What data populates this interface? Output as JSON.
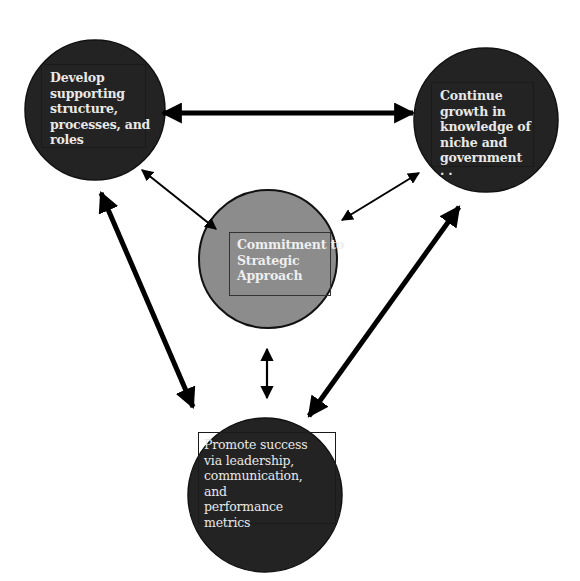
{
  "diagram": {
    "type": "cycle-with-hub",
    "colors": {
      "outer_circle_fill": "#222222",
      "hub_circle_fill": "#8c8c8c",
      "text": "#e8e8e8",
      "arrow": "#000000",
      "background": "#ffffff"
    },
    "nodes": [
      {
        "id": "left",
        "label": "Develop\nsupporting\nstructure,\nprocesses, and\nroles"
      },
      {
        "id": "right",
        "label": "Continue\ngrowth in\nknowledge of\nniche and\ngovernment\n    · ·"
      },
      {
        "id": "hub",
        "label": "Commitment to\nStrategic\nApproach"
      },
      {
        "id": "bottom",
        "label": "Promote success\nvia leadership,\ncommunication,\nand\nperformance\nmetrics"
      }
    ],
    "edges": [
      {
        "from": "left",
        "to": "right",
        "bidirectional": true,
        "weight": "thick"
      },
      {
        "from": "left",
        "to": "bottom",
        "bidirectional": true,
        "weight": "thick"
      },
      {
        "from": "right",
        "to": "bottom",
        "bidirectional": true,
        "weight": "thick"
      },
      {
        "from": "hub",
        "to": "left",
        "bidirectional": true,
        "weight": "thin"
      },
      {
        "from": "hub",
        "to": "right",
        "bidirectional": true,
        "weight": "thin"
      },
      {
        "from": "hub",
        "to": "bottom",
        "bidirectional": true,
        "weight": "thin"
      }
    ]
  }
}
